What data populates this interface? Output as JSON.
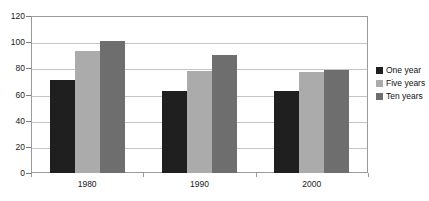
{
  "chart_data": {
    "type": "bar",
    "title": "",
    "subtitle": "",
    "xlabel": "",
    "ylabel": "",
    "categories": [
      "1980",
      "1990",
      "2000"
    ],
    "series": [
      {
        "name": "One year",
        "values": [
          71,
          63,
          63
        ],
        "color": "#1f1f1f"
      },
      {
        "name": "Five years",
        "values": [
          93,
          78,
          77
        ],
        "color": "#ababab"
      },
      {
        "name": "Ten years",
        "values": [
          101,
          90,
          79
        ],
        "color": "#6e6e6e"
      }
    ],
    "ylim": [
      0,
      120
    ],
    "yticks": [
      0,
      20,
      40,
      60,
      80,
      100,
      120
    ],
    "ytick_labels": [
      "0",
      "20",
      "40",
      "60",
      "80",
      "100",
      "120"
    ],
    "grid": true,
    "grid_axis": "y",
    "legend_position": "right",
    "bar_orientation": "vertical",
    "grouping": "grouped"
  },
  "legend": {
    "items": [
      {
        "label": "One year",
        "color": "#1f1f1f"
      },
      {
        "label": "Five years",
        "color": "#ababab"
      },
      {
        "label": "Ten years",
        "color": "#6e6e6e"
      }
    ]
  },
  "colors": {
    "one_year": "#1f1f1f",
    "five_years": "#ababab",
    "ten_years": "#6e6e6e",
    "gridline": "#c4c4c4",
    "axis": "#9a9a9a",
    "text": "#1a1a1a",
    "background": "#ffffff"
  }
}
